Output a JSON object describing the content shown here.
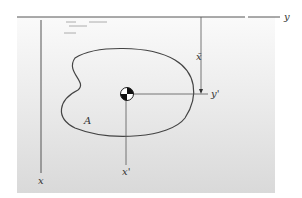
{
  "diagram": {
    "type": "centroid-axes",
    "labels": {
      "y_axis": "y",
      "x_axis": "x",
      "x_prime": "x'",
      "y_prime": "y'",
      "x_bar": "x̄",
      "area": "A"
    },
    "colors": {
      "line": "#444444",
      "background_top": "#fafafa",
      "background_bottom": "#d9d9d9"
    }
  }
}
